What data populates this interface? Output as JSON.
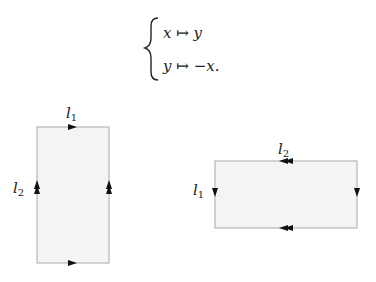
{
  "formula": {
    "line1": {
      "lhs": "x",
      "arrow": "↦",
      "rhs": "y"
    },
    "line2": {
      "lhs": "y",
      "arrow": "↦",
      "rhs": "−x."
    }
  },
  "left_square": {
    "top_label": {
      "name": "l",
      "sub": "1"
    },
    "side_label": {
      "name": "l",
      "sub": "2"
    }
  },
  "right_square": {
    "top_label": {
      "name": "l",
      "sub": "2"
    },
    "side_label": {
      "name": "l",
      "sub": "1"
    }
  },
  "colors": {
    "fill": "#f4f4f4",
    "stroke": "#aaaaaa",
    "arrow": "#111111"
  }
}
